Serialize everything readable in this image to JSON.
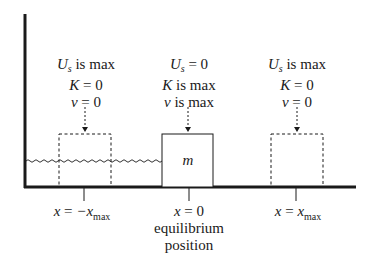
{
  "diagram": {
    "title": "",
    "states": [
      {
        "id": "left",
        "position_label_lhs": "x",
        "position_label_eq": " = ",
        "position_label_rhs": "−x",
        "position_label_sub": "max",
        "energy_line1_var": "U",
        "energy_line1_sub": "s",
        "energy_line1_rest": " is max",
        "energy_line2_var": "K",
        "energy_line2_rest": " = 0",
        "energy_line3_var": "v",
        "energy_line3_rest": " = 0",
        "box_style": "dashed"
      },
      {
        "id": "center",
        "position_label_lhs": "x",
        "position_label_eq": " = 0",
        "caption_line1": "equilibrium",
        "caption_line2": "position",
        "energy_line1_var": "U",
        "energy_line1_sub": "s",
        "energy_line1_rest": " = 0",
        "energy_line2_var": "K",
        "energy_line2_rest": " is max",
        "energy_line3_var": "v",
        "energy_line3_rest": " is max",
        "box_style": "solid",
        "mass_label": "m"
      },
      {
        "id": "right",
        "position_label_lhs": "x",
        "position_label_eq": " = ",
        "position_label_rhs": "x",
        "position_label_sub": "max",
        "energy_line1_var": "U",
        "energy_line1_sub": "s",
        "energy_line1_rest": " is max",
        "energy_line2_var": "K",
        "energy_line2_rest": " = 0",
        "energy_line3_var": "v",
        "energy_line3_rest": " = 0",
        "box_style": "dashed"
      }
    ],
    "colors": {
      "ink": "#1a1a1a",
      "background": "#ffffff"
    }
  }
}
